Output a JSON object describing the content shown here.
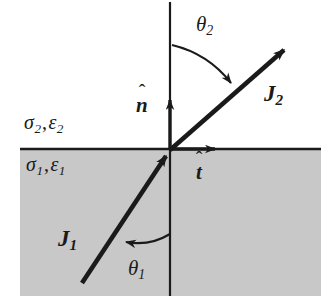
{
  "figure": {
    "background_color": "#ffffff",
    "stroke_color": "#1a1a1a",
    "lower_medium_fill": "#c8c8c8"
  },
  "labels": {
    "medium_upper": {
      "sigma": "σ",
      "sigma_sub": "2",
      "comma": ",",
      "epsilon": "ε",
      "epsilon_sub": "2"
    },
    "medium_lower": {
      "sigma": "σ",
      "sigma_sub": "1",
      "comma": ",",
      "epsilon": "ε",
      "epsilon_sub": "1"
    },
    "current_upper": {
      "symbol": "J",
      "sub": "2"
    },
    "current_lower": {
      "symbol": "J",
      "sub": "1"
    },
    "angle_upper": {
      "symbol": "θ",
      "sub": "2"
    },
    "angle_lower": {
      "symbol": "θ",
      "sub": "1"
    },
    "normal_unit": {
      "symbol": "n",
      "hat": "ˆ"
    },
    "tangent_unit": {
      "symbol": "t",
      "hat": "ˆ"
    }
  },
  "geometry": {
    "origin": {
      "x": 170,
      "y": 150
    },
    "interface_line": {
      "x1": 20,
      "y1": 149,
      "x2": 321,
      "y2": 149
    },
    "normal_line": {
      "x1": 170,
      "y1": 2,
      "x2": 170,
      "y2": 296
    },
    "lower_region": {
      "x": 20,
      "y": 150,
      "width": 301,
      "height": 146
    },
    "ray_incident": {
      "x1": 82,
      "y1": 283,
      "x2": 170,
      "y2": 150
    },
    "ray_refracted": {
      "x1": 170,
      "y1": 150,
      "x2": 288,
      "y2": 46
    },
    "tangent_arrow": {
      "x1": 170,
      "y1": 149,
      "x2": 218,
      "y2": 149
    },
    "normal_arrow": {
      "x1": 170,
      "y1": 149,
      "x2": 170,
      "y2": 97
    },
    "angle_arc_upper": {
      "radius": 46,
      "from_deg": 90,
      "to_deg": 41
    },
    "angle_arc_lower": {
      "radius": 52,
      "from_deg": 270,
      "to_deg": 236
    }
  }
}
